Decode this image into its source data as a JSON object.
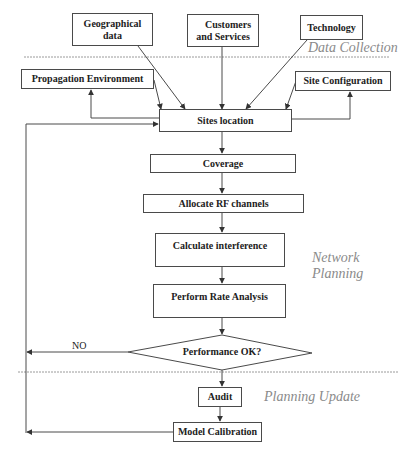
{
  "diagram": {
    "type": "flowchart",
    "phases": {
      "data_collection": "Data Collection",
      "network_planning_line1": "Network",
      "network_planning_line2": "Planning",
      "planning_update": "Planning Update"
    },
    "inputs": {
      "geographical_line1": "Geographical",
      "geographical_line2": "data",
      "customers_line1": "Customers",
      "customers_line2": "and Services",
      "technology": "Technology"
    },
    "side_nodes": {
      "propagation": "Propagation Environment",
      "site_configuration": "Site Configuration"
    },
    "steps": {
      "sites_location": "Sites location",
      "coverage": "Coverage",
      "allocate_rf": "Allocate RF channels",
      "calculate_interference": "Calculate interference",
      "perform_rate": "Perform Rate Analysis",
      "decision": "Performance OK?",
      "audit": "Audit",
      "model_calibration": "Model Calibration"
    },
    "edge_labels": {
      "no": "NO"
    },
    "colors": {
      "stroke": "#4a4a4a",
      "phase_text": "#8a8a8a",
      "divider": "#9a9a9a"
    },
    "edges": [
      {
        "from": "Geographical data",
        "to": "Sites location"
      },
      {
        "from": "Customers and Services",
        "to": "Sites location"
      },
      {
        "from": "Technology",
        "to": "Sites location"
      },
      {
        "from": "Propagation Environment",
        "to": "Sites location"
      },
      {
        "from": "Sites location",
        "to": "Propagation Environment"
      },
      {
        "from": "Site Configuration",
        "to": "Sites location"
      },
      {
        "from": "Sites location",
        "to": "Site Configuration"
      },
      {
        "from": "Sites location",
        "to": "Coverage"
      },
      {
        "from": "Coverage",
        "to": "Allocate RF channels"
      },
      {
        "from": "Allocate RF channels",
        "to": "Calculate interference"
      },
      {
        "from": "Calculate interference",
        "to": "Perform Rate Analysis"
      },
      {
        "from": "Perform Rate Analysis",
        "to": "Performance OK?"
      },
      {
        "from": "Performance OK?",
        "to": "Sites location",
        "label": "NO"
      },
      {
        "from": "Performance OK?",
        "to": "Audit"
      },
      {
        "from": "Audit",
        "to": "Model Calibration"
      },
      {
        "from": "Model Calibration",
        "to": "Sites location"
      }
    ]
  }
}
